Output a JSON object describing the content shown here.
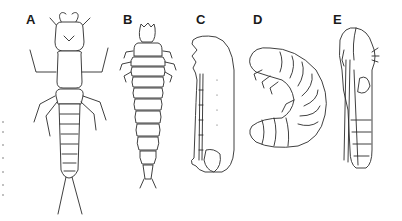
{
  "figure": {
    "panels": [
      {
        "label": "A",
        "description": "campodeiform larva (dorsal view, with cerci)"
      },
      {
        "label": "B",
        "description": "carabiform / elateriform larva (dorsal view)"
      },
      {
        "label": "C",
        "description": "vermiform larva (lateral view)"
      },
      {
        "label": "D",
        "description": "scarabaeiform (C-shaped) larva"
      },
      {
        "label": "E",
        "description": "exarate pupa (lateral view)"
      }
    ]
  }
}
